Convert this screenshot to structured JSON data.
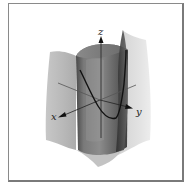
{
  "figure": {
    "axes": {
      "x": {
        "label": "x"
      },
      "y": {
        "label": "y"
      },
      "z": {
        "label": "z"
      }
    },
    "surfaces": [
      {
        "name": "back-curved-surface",
        "color": "#c8c8c8"
      },
      {
        "name": "parabolic-cylinder",
        "color": "#6e6e6e"
      }
    ],
    "curve": {
      "name": "intersection-curve",
      "color": "#111111"
    },
    "colors": {
      "frame": "#8a8a8a",
      "background": "#ffffff",
      "light_surface": "#cfcfcf",
      "dark_surface": "#5a5a5a"
    }
  }
}
